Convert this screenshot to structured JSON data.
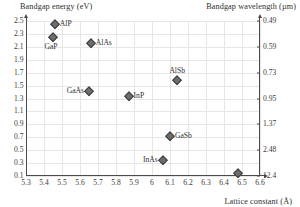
{
  "chart_data": {
    "type": "scatter",
    "title": "",
    "xlabel": "Lattice constant (Å)",
    "ylabel": "Bandgap energy (eV)",
    "y2label": "Bandgap wavelength (µm)",
    "xlim": [
      5.3,
      6.6
    ],
    "ylim": [
      0.1,
      2.5
    ],
    "grid": true,
    "legend": "none",
    "xticks": [
      "5.3",
      "5.4",
      "5.5",
      "5.6",
      "5.7",
      "5.8",
      "5.9",
      "6",
      "6.1",
      "6.2",
      "6.3",
      "6.4",
      "6.5",
      "6.6"
    ],
    "xtick_values": [
      5.3,
      5.4,
      5.5,
      5.6,
      5.7,
      5.8,
      5.9,
      6.0,
      6.1,
      6.2,
      6.3,
      6.4,
      6.5,
      6.6
    ],
    "yticks": [
      "0.1",
      "0.3",
      "0.5",
      "0.7",
      "0.9",
      "1.1",
      "1.3",
      "1.5",
      "1.7",
      "1.9",
      "2.1",
      "2.3",
      "2.5"
    ],
    "ytick_values": [
      0.1,
      0.3,
      0.5,
      0.7,
      0.9,
      1.1,
      1.3,
      1.5,
      1.7,
      1.9,
      2.1,
      2.3,
      2.5
    ],
    "y2ticks": [
      "0.49",
      "0.59",
      "0.73",
      "0.95",
      "1.37",
      "2.48",
      "12.4"
    ],
    "y2tick_energies": [
      2.5,
      2.1,
      1.7,
      1.3,
      0.9,
      0.5,
      0.1
    ],
    "points": [
      {
        "name": "AlP",
        "x": 5.46,
        "y": 2.45,
        "label": "AlP",
        "label_pos": "right"
      },
      {
        "name": "GaP",
        "x": 5.45,
        "y": 2.26,
        "label": "GaP",
        "label_pos": "below-left"
      },
      {
        "name": "AlAs",
        "x": 5.66,
        "y": 2.16,
        "label": "AlAs",
        "label_pos": "right"
      },
      {
        "name": "GaAs",
        "x": 5.65,
        "y": 1.42,
        "label": "GaAs",
        "label_pos": "left"
      },
      {
        "name": "InP",
        "x": 5.87,
        "y": 1.34,
        "label": "InP",
        "label_pos": "right"
      },
      {
        "name": "AlSb",
        "x": 6.14,
        "y": 1.58,
        "label": "AlSb",
        "label_pos": "above"
      },
      {
        "name": "GaSb",
        "x": 6.1,
        "y": 0.72,
        "label": "GaSb",
        "label_pos": "right"
      },
      {
        "name": "InAs",
        "x": 6.06,
        "y": 0.35,
        "label": "InAs",
        "label_pos": "left"
      },
      {
        "name": "InSb",
        "x": 6.48,
        "y": 0.15,
        "label": "",
        "label_pos": "none"
      }
    ]
  },
  "axes": {
    "left_title": "Bandgap energy (eV)",
    "right_title": "Bandgap wavelength (µm)",
    "x_title": "Lattice constant (Å)"
  },
  "colors": {
    "marker_fill": "#6d6d6d",
    "marker_edge": "#3d3d3d",
    "axis": "#4a4a4a",
    "grid": "#e6e6e6",
    "text": "#2e2e2e",
    "background": "#ffffff"
  }
}
